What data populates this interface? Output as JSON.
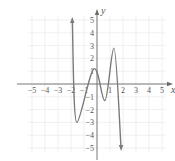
{
  "chart_data": {
    "type": "line",
    "title": "",
    "xlabel": "x",
    "ylabel": "y",
    "xlim": [
      -5,
      5
    ],
    "ylim": [
      -5,
      5
    ],
    "grid": true,
    "x_ticks": [
      -5,
      -4,
      -3,
      -2,
      -1,
      1,
      2,
      3,
      4,
      5
    ],
    "y_ticks": [
      5,
      4,
      3,
      2,
      1,
      -1,
      -2,
      -3,
      -4,
      -5
    ],
    "x_tick_labels": [
      "−5",
      "−4",
      "−3",
      "−2",
      "−1",
      "1",
      "2",
      "3",
      "4",
      "5"
    ],
    "y_tick_labels": [
      "5",
      "4",
      "3",
      "2",
      "1",
      "−1",
      "−2",
      "−3",
      "−4",
      "−5"
    ],
    "series": [
      {
        "name": "polynomial curve",
        "description": "odd-degree-like polynomial with arrows at both ends: rising to +∞ at left, falling to −∞ at right",
        "points": [
          {
            "x": -1.9,
            "y": 5.0
          },
          {
            "x": -1.55,
            "y": -3.0
          },
          {
            "x": -0.2,
            "y": 1.2
          },
          {
            "x": 0.6,
            "y": -1.3
          },
          {
            "x": 1.3,
            "y": 2.8
          },
          {
            "x": 1.85,
            "y": -5.0
          }
        ],
        "end_behavior": {
          "left": "arrow up",
          "right": "arrow down"
        },
        "color": "#7a7a7a"
      }
    ]
  },
  "colors": {
    "grid": "#e6e6e6",
    "axis": "#6b6b6b",
    "curve": "#7a7a7a",
    "text": "#555555"
  }
}
